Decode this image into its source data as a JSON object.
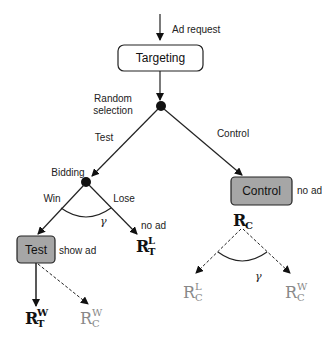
{
  "diagram": {
    "nodes": {
      "ad_request": "Ad request",
      "targeting": "Targeting",
      "random_selection_line1": "Random",
      "random_selection_line2": "selection",
      "bidding": "Bidding",
      "test_box": "Test",
      "control_box": "Control"
    },
    "edges": {
      "test": "Test",
      "control": "Control",
      "win": "Win",
      "lose": "Lose"
    },
    "annotations": {
      "show_ad": "show ad",
      "no_ad_lose": "no ad",
      "no_ad_control": "no ad",
      "gamma_bidding": "γ",
      "gamma_control": "γ"
    },
    "outcomes": {
      "R_T_W": {
        "base": "R",
        "sup": "W",
        "sub": "T"
      },
      "R_T_L": {
        "base": "R",
        "sup": "L",
        "sub": "T"
      },
      "R_C_W_test": {
        "base": "R",
        "sup": "W",
        "sub": "C"
      },
      "R_C": {
        "base": "R",
        "sub": "C"
      },
      "R_C_L": {
        "base": "R",
        "sup": "L",
        "sub": "C"
      },
      "R_C_W": {
        "base": "R",
        "sup": "W",
        "sub": "C"
      }
    },
    "colors": {
      "line": "#222222",
      "box_fill_gray": "#a6a6a6",
      "box_fill_white": "#ffffff",
      "counterfactual_text": "#888888"
    }
  }
}
